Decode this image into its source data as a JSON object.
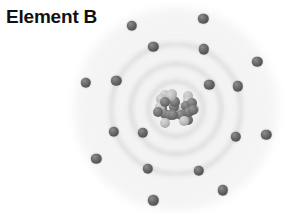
{
  "label": {
    "title": "Element B"
  },
  "colors": {
    "background": "#ffffff",
    "title_text": "#111111",
    "electron": "#5a5a5a",
    "shell_ring": "#d6d6d6",
    "nucleus_dark": "#6a6a6a",
    "nucleus_light": "#c0c0c0"
  },
  "diagram": {
    "type": "bohr-atom-model",
    "center": {
      "x": 176,
      "y": 109
    },
    "nucleus": {
      "label": "nucleus",
      "center_x": 176,
      "center_y": 109,
      "radius": 23,
      "nucleon_count": 30,
      "nucleon_radius": 5.0
    },
    "shells": [
      {
        "name": "shell-1",
        "index": 1,
        "radius": 41,
        "electron_count": 2,
        "electron_angles": [
          144,
          324
        ]
      },
      {
        "name": "shell-2",
        "index": 2,
        "radius": 66,
        "electron_count": 8,
        "electron_angles": [
          250,
          295,
          340,
          25,
          70,
          115,
          160,
          205
        ]
      },
      {
        "name": "shell-3",
        "index": 3,
        "radius": 94,
        "electron_count": 8,
        "electron_angles": [
          242,
          287,
          330,
          16,
          60,
          104,
          148,
          196
        ]
      }
    ],
    "electron_radius": 5.2,
    "total_electrons": 18
  }
}
